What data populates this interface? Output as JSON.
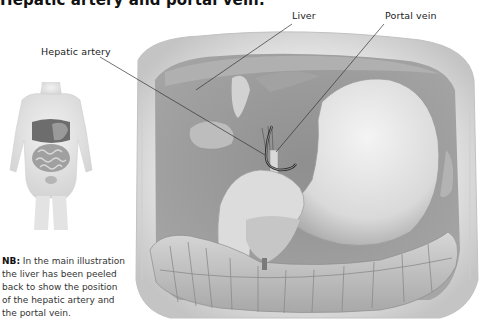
{
  "figure": {
    "title": "Hepatic artery and portal vein.",
    "labels": {
      "hepatic_artery": "Hepatic artery",
      "liver": "Liver",
      "portal_vein": "Portal vein"
    },
    "note": {
      "prefix": "NB:",
      "text": " In the main illustration the liver has been peeled back to show the position of the hepatic artery and the portal vein."
    },
    "inset": "small human torso showing location of abdominal organs",
    "main_illustration": "abdominal cavity with stomach, liver peeled back, gallbladder, colon, hepatic artery and portal vein",
    "colors": {
      "text": "#1a1a1a",
      "leader_line": "#333333",
      "tissue_dark": "#8c8c8c",
      "tissue_mid": "#bdbdbd",
      "tissue_light": "#e6e6e6"
    }
  }
}
